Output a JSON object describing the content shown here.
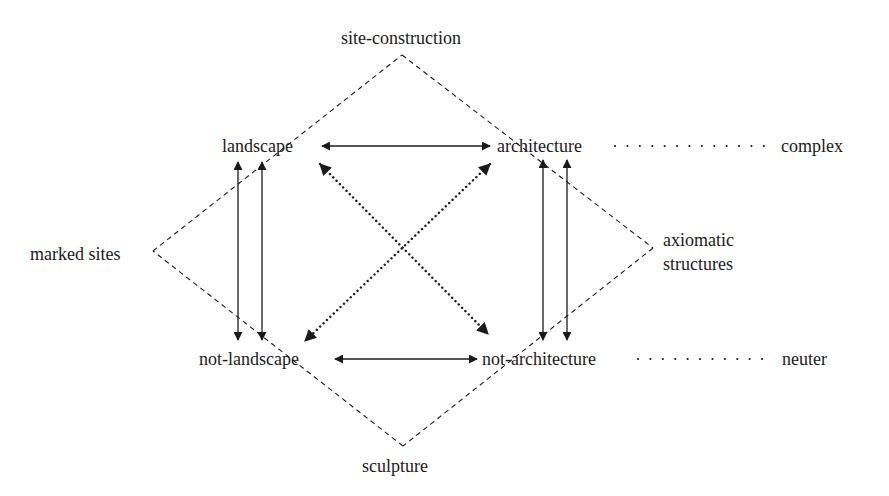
{
  "diagram": {
    "nodes": {
      "landscape": "landscape",
      "architecture": "architecture",
      "not_landscape": "not-landscape",
      "not_architecture": "not-architecture"
    },
    "categories": {
      "site_construction": "site-construction",
      "marked_sites": "marked sites",
      "axiomatic_line1": "axiomatic",
      "axiomatic_line2": "structures",
      "sculpture": "sculpture"
    },
    "terms": {
      "complex": "complex",
      "neuter": "neuter"
    },
    "relations": [
      {
        "from": "landscape",
        "to": "architecture",
        "style": "solid",
        "heads": "both"
      },
      {
        "from": "not-landscape",
        "to": "not-architecture",
        "style": "solid",
        "heads": "both"
      },
      {
        "from": "landscape",
        "to": "not-landscape",
        "style": "solid-double",
        "heads": "both"
      },
      {
        "from": "architecture",
        "to": "not-architecture",
        "style": "solid-double",
        "heads": "both"
      },
      {
        "from": "landscape",
        "to": "not-architecture",
        "style": "dotted",
        "heads": "both"
      },
      {
        "from": "architecture",
        "to": "not-landscape",
        "style": "dotted",
        "heads": "both"
      },
      {
        "from": "architecture",
        "to": "complex",
        "style": "dotted-leader",
        "heads": "none"
      },
      {
        "from": "not-architecture",
        "to": "neuter",
        "style": "dotted-leader",
        "heads": "none"
      }
    ],
    "diamond": {
      "style": "dashed",
      "corners": [
        "site-construction",
        "axiomatic structures",
        "sculpture",
        "marked sites"
      ]
    },
    "colors": {
      "ink": "#1a1a1a",
      "background": "#ffffff"
    }
  }
}
